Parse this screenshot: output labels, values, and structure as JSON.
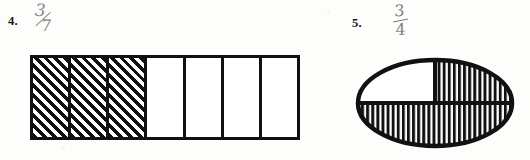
{
  "page": {
    "kind": "math-worksheet-scan",
    "background_color": "#fdfdfb",
    "ink_color": "#111111",
    "handwriting_color": "#5a5a5a"
  },
  "problems": [
    {
      "number_label": "4.",
      "handwritten_answer": {
        "numerator": "3",
        "denominator": "7",
        "as_text": "3/7"
      },
      "figure": {
        "shape": "bar-model",
        "total_parts": 7,
        "shaded_parts": 3,
        "shade_style": "diagonal-hatch",
        "shaded_indices": [
          0,
          1,
          2
        ],
        "cells": [
          {
            "index": 1,
            "shaded": true
          },
          {
            "index": 2,
            "shaded": true
          },
          {
            "index": 3,
            "shaded": true
          },
          {
            "index": 4,
            "shaded": false
          },
          {
            "index": 5,
            "shaded": false
          },
          {
            "index": 6,
            "shaded": false
          },
          {
            "index": 7,
            "shaded": false
          }
        ]
      }
    },
    {
      "number_label": "5.",
      "handwritten_answer": {
        "numerator": "3",
        "denominator": "4",
        "as_text": "3/4"
      },
      "figure": {
        "shape": "ellipse-model",
        "total_parts": 4,
        "shaded_parts": 3,
        "shade_style": "vertical-hatch",
        "regions": [
          {
            "name": "upper-left",
            "shaded": false
          },
          {
            "name": "upper-right",
            "shaded": true
          },
          {
            "name": "lower-left",
            "shaded": true
          },
          {
            "name": "lower-right",
            "shaded": true
          }
        ]
      }
    }
  ]
}
